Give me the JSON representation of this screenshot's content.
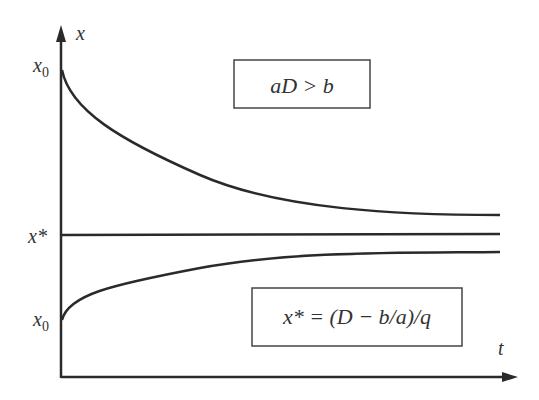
{
  "axes": {
    "y_label": "x",
    "x_label": "t"
  },
  "tick_labels": {
    "x0_top": "x",
    "x0_top_sub": "0",
    "x_star": "x*",
    "x0_bottom": "x",
    "x0_bottom_sub": "0"
  },
  "boxes": {
    "condition": "aD > b",
    "equilibrium": "x* = (D − b/a)/q"
  },
  "curves": [
    {
      "name": "decreasing-from-above",
      "start": "x0 (above x*)",
      "asymptote": "x*"
    },
    {
      "name": "equilibrium-line",
      "value": "x*"
    },
    {
      "name": "increasing-from-below",
      "start": "x0 (below x*)",
      "asymptote": "x*"
    }
  ],
  "colors": {
    "stroke": "#2a2a2a",
    "text": "#333333",
    "background": "#ffffff"
  }
}
